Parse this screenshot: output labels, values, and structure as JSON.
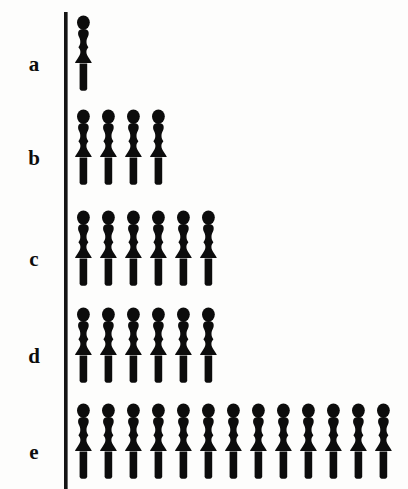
{
  "chart_data": {
    "type": "bar",
    "subtype": "pictogram",
    "title": "",
    "subtitle": "",
    "xlabel": "",
    "ylabel": "",
    "orientation": "horizontal",
    "grid": false,
    "legend": null,
    "icon": "person-figure",
    "icon_unit_value": 1,
    "categories": [
      "a",
      "b",
      "c",
      "d",
      "e"
    ],
    "values": [
      1,
      4,
      6,
      6,
      13
    ],
    "xlim": [
      0,
      13
    ],
    "tick_labels": [],
    "annotations": [],
    "colors": {
      "figure": "#0c0c0c",
      "axis": "#151515",
      "background": "#fdfdfc",
      "label": "#0d0d0d"
    },
    "rows": [
      {
        "label": "a",
        "value": 1
      },
      {
        "label": "b",
        "value": 4
      },
      {
        "label": "c",
        "value": 6
      },
      {
        "label": "d",
        "value": 6
      },
      {
        "label": "e",
        "value": 13
      }
    ]
  }
}
